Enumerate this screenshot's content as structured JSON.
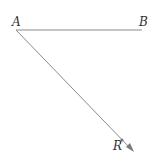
{
  "diagram": {
    "type": "geometry",
    "points": [
      {
        "label": "A",
        "x": 16,
        "y": 30
      },
      {
        "label": "B",
        "x": 142,
        "y": 30
      },
      {
        "label": "R",
        "x": 122,
        "y": 140
      }
    ],
    "segments": [
      {
        "from": "A",
        "to": "B",
        "kind": "segment"
      },
      {
        "from": "A",
        "to": "R",
        "kind": "ray"
      }
    ],
    "labels": {
      "a": "A",
      "b": "B",
      "r": "R"
    },
    "colors": {
      "line": "#8a8a8a",
      "text": "#333333"
    }
  }
}
